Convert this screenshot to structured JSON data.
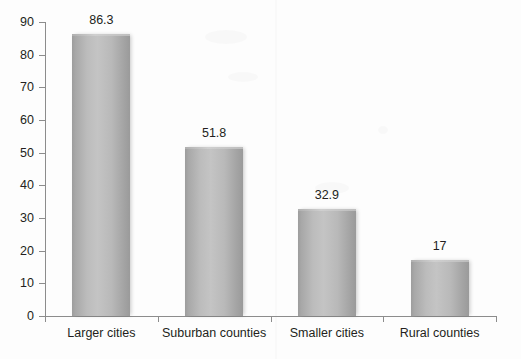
{
  "chart_data": {
    "type": "bar",
    "title": "",
    "subtitle": "",
    "xlabel": "",
    "ylabel": "",
    "categories": [
      "Larger cities",
      "Suburban counties",
      "Smaller cities",
      "Rural counties"
    ],
    "values": [
      86.3,
      51.8,
      32.9,
      17
    ],
    "value_labels": [
      "86.3",
      "51.8",
      "32.9",
      "17"
    ],
    "ylim": [
      0,
      90
    ],
    "ytick_step": 10,
    "ytick_labels": [
      "0",
      "10",
      "20",
      "30",
      "40",
      "50",
      "60",
      "70",
      "80",
      "90"
    ],
    "grid": false,
    "legend": false,
    "legend_position": "none",
    "annotations": [],
    "colors": {
      "bar_fill_light": "#c4c4c4",
      "bar_fill_dark": "#9a9a9a",
      "axis": "#8c8c8c",
      "text": "#231f20",
      "background": "#fdfdfd"
    }
  },
  "axis": {
    "y_ticks": [
      {
        "label": "90",
        "value": 90
      },
      {
        "label": "80",
        "value": 80
      },
      {
        "label": "70",
        "value": 70
      },
      {
        "label": "60",
        "value": 60
      },
      {
        "label": "50",
        "value": 50
      },
      {
        "label": "40",
        "value": 40
      },
      {
        "label": "30",
        "value": 30
      },
      {
        "label": "20",
        "value": 20
      },
      {
        "label": "10",
        "value": 10
      },
      {
        "label": "0",
        "value": 0
      }
    ]
  },
  "bars": [
    {
      "category": "Larger cities",
      "value": 86.3,
      "label": "86.3"
    },
    {
      "category": "Suburban counties",
      "value": 51.8,
      "label": "51.8"
    },
    {
      "category": "Smaller cities",
      "value": 32.9,
      "label": "32.9"
    },
    {
      "category": "Rural counties",
      "value": 17,
      "label": "17"
    }
  ]
}
